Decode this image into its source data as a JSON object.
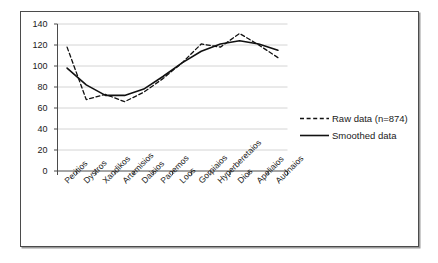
{
  "chart_data": {
    "type": "line",
    "title": "",
    "xlabel": "",
    "ylabel": "",
    "ylim": [
      0,
      140
    ],
    "ytick_step": 20,
    "yticks": [
      "0",
      "20",
      "40",
      "60",
      "80",
      "100",
      "120",
      "140"
    ],
    "grid": true,
    "legend_position": "right",
    "categories": [
      "Peritios",
      "Dystros",
      "Xandikos",
      "Artemisios",
      "Daisios",
      "Panemos",
      "Loos",
      "Gorpiaios",
      "Hyperberetaios",
      "Dios",
      "Apeliaios",
      "Audnaios"
    ],
    "series": [
      {
        "name": "Raw data (n=874)",
        "style": "dashed",
        "color": "#111111",
        "values": [
          118,
          68,
          73,
          66,
          75,
          88,
          103,
          121,
          118,
          131,
          120,
          108
        ]
      },
      {
        "name": "Smoothed data",
        "style": "solid",
        "color": "#111111",
        "values": [
          98,
          82,
          72,
          72,
          78,
          90,
          103,
          114,
          121,
          124,
          121,
          115
        ]
      }
    ]
  },
  "legend": {
    "entries": [
      {
        "label": "Raw data (n=874)",
        "style": "dashed"
      },
      {
        "label": "Smoothed data",
        "style": "solid"
      }
    ]
  },
  "colors": {
    "axis": "#4b4b4b",
    "grid": "#c9c9c9",
    "line": "#111111",
    "frame": "#4b4b4b",
    "text": "#1a1a1a",
    "background": "#ffffff"
  }
}
